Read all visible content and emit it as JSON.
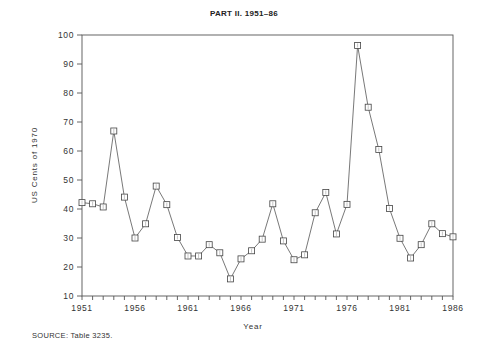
{
  "chart_data": {
    "type": "line",
    "title": "PART II. 1951–86",
    "xlabel": "Year",
    "ylabel": "US Cents of 1970",
    "ylim": [
      10,
      100
    ],
    "xlim": [
      1951,
      1986
    ],
    "grid": false,
    "legend": null,
    "marker": "square",
    "x_ticks": [
      1951,
      1956,
      1961,
      1966,
      1971,
      1976,
      1981,
      1986
    ],
    "y_ticks": [
      10,
      20,
      30,
      40,
      50,
      60,
      70,
      80,
      90,
      100
    ],
    "x": [
      1951,
      1952,
      1953,
      1954,
      1955,
      1956,
      1957,
      1958,
      1959,
      1960,
      1961,
      1962,
      1963,
      1964,
      1965,
      1966,
      1967,
      1968,
      1969,
      1970,
      1971,
      1972,
      1973,
      1974,
      1975,
      1976,
      1977,
      1978,
      1979,
      1980,
      1981,
      1982,
      1983,
      1984,
      1985,
      1986
    ],
    "series": [
      {
        "name": "US Cents of 1970",
        "values": [
          42.2,
          41.8,
          40.7,
          66.9,
          44.1,
          30.0,
          34.9,
          47.9,
          41.5,
          30.2,
          23.8,
          23.8,
          27.7,
          24.9,
          15.9,
          22.8,
          25.6,
          29.6,
          41.8,
          29.0,
          22.5,
          24.2,
          38.7,
          45.7,
          31.4,
          41.6,
          96.4,
          75.1,
          60.5,
          40.2,
          29.9,
          23.1,
          27.7,
          34.9,
          31.5,
          30.4
        ]
      }
    ]
  },
  "footer": {
    "source": "SOURCE: Table 3235."
  }
}
